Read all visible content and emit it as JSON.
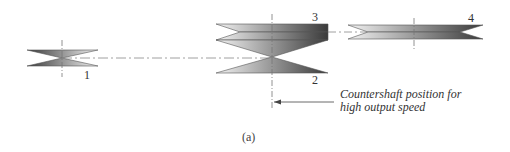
{
  "diagram": {
    "gear_labels": {
      "gear1": "1",
      "gear2": "2",
      "gear3": "3",
      "gear4": "4"
    },
    "annotation": {
      "line1": "Countershaft position for",
      "line2": "high output speed"
    },
    "figure_label": "(a)",
    "colors": {
      "gear_dark": "#3a3a3a",
      "gear_light": "#f0f0f0",
      "outline": "#555555",
      "centerline": "#777777"
    }
  }
}
